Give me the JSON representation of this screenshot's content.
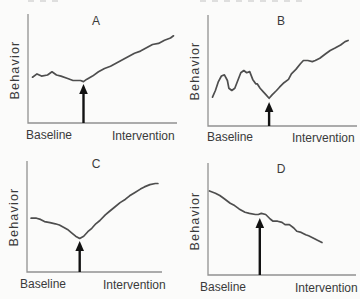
{
  "figure": {
    "colors": {
      "line": "#4e4e4e",
      "axis": "#919191",
      "arrow": "#121212",
      "text": "#3a3a3a",
      "bg": "#fbfbfa"
    }
  },
  "chart_data": [
    {
      "type": "line",
      "title": "A",
      "ylabel": "Behavior",
      "phases": [
        "Baseline",
        "Intervention"
      ],
      "axis_numeric": false,
      "xlim": [
        0,
        100
      ],
      "ylim": [
        0,
        100
      ],
      "intervention_x": 37,
      "points": [
        [
          3,
          42
        ],
        [
          6,
          45
        ],
        [
          9,
          43
        ],
        [
          13,
          44
        ],
        [
          16,
          47
        ],
        [
          19,
          44
        ],
        [
          22,
          43
        ],
        [
          26,
          41
        ],
        [
          30,
          39
        ],
        [
          35,
          39
        ],
        [
          37,
          38
        ],
        [
          39,
          40
        ],
        [
          43,
          43
        ],
        [
          47,
          47
        ],
        [
          51,
          50
        ],
        [
          55,
          52
        ],
        [
          59,
          55
        ],
        [
          63,
          58
        ],
        [
          67,
          61
        ],
        [
          71,
          64
        ],
        [
          75,
          66
        ],
        [
          79,
          69
        ],
        [
          83,
          72
        ],
        [
          87,
          73
        ],
        [
          91,
          76
        ],
        [
          95,
          78
        ],
        [
          97,
          80
        ]
      ]
    },
    {
      "type": "line",
      "title": "B",
      "ylabel": "Behavior",
      "phases": [
        "Baseline",
        "Intervention"
      ],
      "axis_numeric": false,
      "xlim": [
        0,
        100
      ],
      "ylim": [
        0,
        100
      ],
      "intervention_x": 41,
      "points": [
        [
          3,
          26
        ],
        [
          5,
          32
        ],
        [
          7,
          40
        ],
        [
          9,
          45
        ],
        [
          11,
          46
        ],
        [
          13,
          41
        ],
        [
          14,
          34
        ],
        [
          16,
          32
        ],
        [
          18,
          34
        ],
        [
          20,
          41
        ],
        [
          22,
          48
        ],
        [
          24,
          50
        ],
        [
          26,
          48
        ],
        [
          28,
          49
        ],
        [
          30,
          42
        ],
        [
          32,
          38
        ],
        [
          33,
          38
        ],
        [
          35,
          34
        ],
        [
          37,
          31
        ],
        [
          39,
          28
        ],
        [
          41,
          25
        ],
        [
          43,
          28
        ],
        [
          46,
          32
        ],
        [
          48,
          35
        ],
        [
          51,
          39
        ],
        [
          54,
          42
        ],
        [
          56,
          47
        ],
        [
          59,
          51
        ],
        [
          62,
          56
        ],
        [
          64,
          59
        ],
        [
          67,
          59
        ],
        [
          70,
          58
        ],
        [
          72,
          59
        ],
        [
          75,
          61
        ],
        [
          79,
          65
        ],
        [
          82,
          68
        ],
        [
          85,
          70
        ],
        [
          89,
          73
        ],
        [
          92,
          76
        ],
        [
          94,
          77
        ]
      ]
    },
    {
      "type": "line",
      "title": "C",
      "ylabel": "Behavior",
      "phases": [
        "Baseline",
        "Intervention"
      ],
      "axis_numeric": false,
      "xlim": [
        0,
        100
      ],
      "ylim": [
        0,
        100
      ],
      "intervention_x": 39,
      "points": [
        [
          3,
          48
        ],
        [
          7,
          48
        ],
        [
          10,
          47
        ],
        [
          13,
          45
        ],
        [
          17,
          44
        ],
        [
          21,
          43
        ],
        [
          24,
          42
        ],
        [
          27,
          40
        ],
        [
          30,
          38
        ],
        [
          33,
          35
        ],
        [
          36,
          32
        ],
        [
          39,
          30
        ],
        [
          42,
          32
        ],
        [
          45,
          36
        ],
        [
          48,
          39
        ],
        [
          51,
          43
        ],
        [
          54,
          46
        ],
        [
          58,
          51
        ],
        [
          61,
          54
        ],
        [
          65,
          58
        ],
        [
          69,
          62
        ],
        [
          73,
          65
        ],
        [
          76,
          68
        ],
        [
          80,
          71
        ],
        [
          84,
          74
        ],
        [
          87,
          76
        ],
        [
          91,
          78
        ],
        [
          95,
          79
        ],
        [
          97,
          79
        ]
      ]
    },
    {
      "type": "line",
      "title": "D",
      "ylabel": "Behavior",
      "phases": [
        "Baseline",
        "Intervention"
      ],
      "axis_numeric": false,
      "xlim": [
        0,
        100
      ],
      "ylim": [
        0,
        100
      ],
      "intervention_x": 35,
      "points": [
        [
          1,
          75
        ],
        [
          5,
          73
        ],
        [
          8,
          71
        ],
        [
          11,
          68
        ],
        [
          15,
          64
        ],
        [
          18,
          62
        ],
        [
          21,
          59
        ],
        [
          25,
          56
        ],
        [
          28,
          55
        ],
        [
          32,
          54
        ],
        [
          34,
          54
        ],
        [
          36,
          55
        ],
        [
          39,
          54
        ],
        [
          42,
          50
        ],
        [
          44,
          48
        ],
        [
          47,
          48
        ],
        [
          50,
          47
        ],
        [
          52,
          45
        ],
        [
          55,
          45
        ],
        [
          58,
          42
        ],
        [
          60,
          39
        ],
        [
          63,
          38
        ],
        [
          66,
          36
        ],
        [
          68,
          35
        ],
        [
          71,
          33
        ],
        [
          74,
          31
        ],
        [
          77,
          29
        ]
      ]
    }
  ]
}
